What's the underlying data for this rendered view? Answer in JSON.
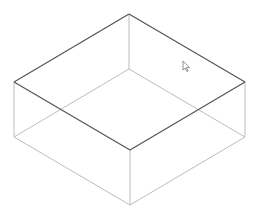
{
  "viewport": {
    "width": 254,
    "height": 215,
    "background": "#ffffff"
  },
  "shape": {
    "type": "box-wireframe",
    "vertices": {
      "top_back": [
        129,
        14
      ],
      "top_left": [
        14,
        82
      ],
      "top_right": [
        245,
        82
      ],
      "top_front": [
        130,
        150
      ],
      "bottom_back": [
        129,
        69
      ],
      "bottom_left": [
        14,
        137
      ],
      "bottom_right": [
        245,
        137
      ],
      "bottom_front": [
        130,
        205
      ]
    },
    "colors": {
      "top_edge": "#555555",
      "other_edge": "#bdbdbd"
    }
  },
  "cursor": {
    "icon": "arrow-pointer-icon",
    "position": [
      184,
      63
    ]
  }
}
